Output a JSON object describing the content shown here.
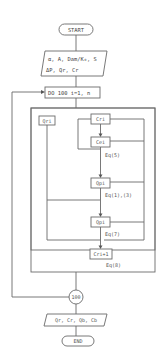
{
  "flowchart": {
    "start": "START",
    "input": {
      "line1": "α, A, Dam/K₀, S",
      "line2": "ΔP, Qr, Cr"
    },
    "loop": "DO 100 i=1, n",
    "nodes": {
      "qr_left": "Qri",
      "cr_top": "Cri",
      "ce": "Cei",
      "qp1": "Qpi",
      "qp2": "Qpi",
      "cr_next": "Cri+1"
    },
    "equations": {
      "eq5": "Eq(5)",
      "eq13": "Eq(1),(3)",
      "eq7": "Eq(7)",
      "eq8": "Eq(8)"
    },
    "connector": "100",
    "output": "Qr, Cr, Qb, Cb",
    "end": "END"
  },
  "colors": {
    "line": "#6a6a6a",
    "text": "#444444",
    "background": "#ffffff"
  }
}
